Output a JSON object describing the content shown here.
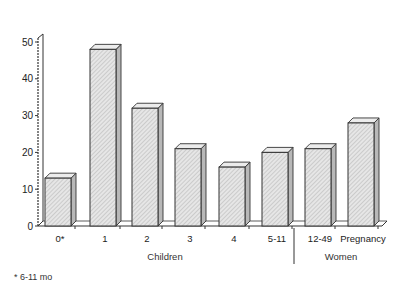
{
  "chart_data": {
    "type": "bar",
    "title": "",
    "xlabel": "",
    "ylabel": "",
    "ylim": [
      0,
      50
    ],
    "yticks": [
      0,
      10,
      20,
      30,
      40,
      50
    ],
    "grid": false,
    "style": "3d-hatched",
    "categories": [
      "0*",
      "1",
      "2",
      "3",
      "4",
      "5-11",
      "12-49",
      "Pregnancy"
    ],
    "values": [
      13,
      48,
      32,
      21,
      16,
      20,
      21,
      28
    ],
    "groups": [
      {
        "label": "Children",
        "categories": [
          "0*",
          "1",
          "2",
          "3",
          "4",
          "5-11"
        ]
      },
      {
        "label": "Women",
        "categories": [
          "12-49",
          "Pregnancy"
        ]
      }
    ],
    "footnote": "* 6-11 mo",
    "colors": {
      "bar_front": "#d9d9d9",
      "bar_side": "#b8b8b8",
      "bar_top": "#ececec",
      "outline": "#333333"
    }
  }
}
